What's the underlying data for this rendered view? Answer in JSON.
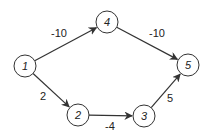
{
  "diagram": {
    "type": "directed-weighted-graph",
    "nodes": [
      {
        "id": "1",
        "label": "1",
        "x": 25,
        "y": 66
      },
      {
        "id": "2",
        "label": "2",
        "x": 78,
        "y": 115
      },
      {
        "id": "3",
        "label": "3",
        "x": 144,
        "y": 116
      },
      {
        "id": "4",
        "label": "4",
        "x": 107,
        "y": 22
      },
      {
        "id": "5",
        "label": "5",
        "x": 188,
        "y": 65
      }
    ],
    "edges": [
      {
        "from": "1",
        "to": "4",
        "weight": "-10",
        "lx": 59,
        "ly": 33
      },
      {
        "from": "4",
        "to": "5",
        "weight": "-10",
        "lx": 157,
        "ly": 33
      },
      {
        "from": "1",
        "to": "2",
        "weight": "2",
        "lx": 43,
        "ly": 96
      },
      {
        "from": "2",
        "to": "3",
        "weight": "-4",
        "lx": 110,
        "ly": 126
      },
      {
        "from": "3",
        "to": "5",
        "weight": "5",
        "lx": 170,
        "ly": 98
      }
    ],
    "colors": {
      "stroke": "#333333",
      "text": "#222222",
      "background": "#ffffff"
    }
  }
}
